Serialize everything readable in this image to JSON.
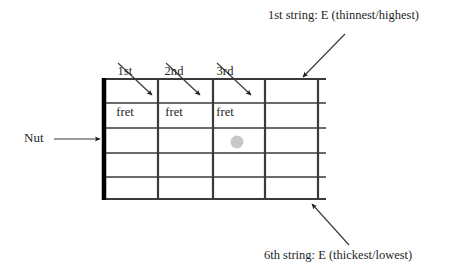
{
  "diagram": {
    "background_color": "#ffffff",
    "line_color": "#3a3a3a",
    "nut_color": "#000000",
    "marker_color": "#c8c8c8",
    "text_color": "#262626"
  },
  "labels": {
    "nut": "Nut",
    "fret_1_line1": "1st",
    "fret_1_line2": "fret",
    "fret_2_line1": "2nd",
    "fret_2_line2": "fret",
    "fret_3_line1": "3rd",
    "fret_3_line2": "fret",
    "string_1": "1st string: E (thinnest/highest)",
    "string_6": "6th string: E (thickest/lowest)"
  },
  "fretboard": {
    "nut_x": 104,
    "nut_top": 79,
    "nut_bottom": 199,
    "nut_width": 4.5,
    "string_line_start_x": 104,
    "string_line_end_x": 326,
    "string_y": [
      79,
      103,
      128,
      153,
      177,
      199
    ],
    "fret_x": [
      158,
      213,
      265,
      318
    ],
    "fret_top": 79,
    "fret_bottom": 199,
    "string_count": 6,
    "fret_count": 4
  },
  "marker": {
    "name": "position-dot",
    "cx": 237,
    "cy": 142,
    "r": 6.5,
    "color": "#c8c8c8"
  },
  "arrows": [
    {
      "name": "arrow-fret-1",
      "x1": 118,
      "y1": 63,
      "x2": 152,
      "y2": 95
    },
    {
      "name": "arrow-fret-2",
      "x1": 166,
      "y1": 63,
      "x2": 200,
      "y2": 95
    },
    {
      "name": "arrow-fret-3",
      "x1": 217,
      "y1": 63,
      "x2": 251,
      "y2": 95
    },
    {
      "name": "arrow-nut",
      "x1": 54,
      "y1": 139,
      "x2": 100,
      "y2": 139
    },
    {
      "name": "arrow-string-1",
      "x1": 345,
      "y1": 34,
      "x2": 303,
      "y2": 77
    },
    {
      "name": "arrow-string-6",
      "x1": 349,
      "y1": 245,
      "x2": 312,
      "y2": 204
    }
  ]
}
